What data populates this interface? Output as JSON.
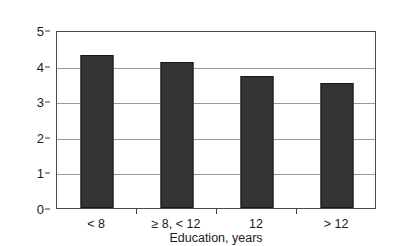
{
  "chart_data": {
    "type": "bar",
    "title": "",
    "categories": [
      "< 8",
      "≥ 8, < 12",
      "12",
      "> 12"
    ],
    "values": [
      4.3,
      4.1,
      3.7,
      3.5
    ],
    "xlabel": "Education, years",
    "ylabel": "Mean allostatic load",
    "ylim": [
      0,
      5
    ],
    "yticks": [
      0,
      1,
      2,
      3,
      4,
      5
    ],
    "ytick_labels": [
      "0",
      "1",
      "2",
      "3",
      "4",
      "5"
    ],
    "grid": "horizontal",
    "legend": "none",
    "bar_color": "#343434",
    "plot_border_color": "#4a4a4a",
    "gridline_color": "#9a9a9a",
    "background": "#ffffff"
  }
}
